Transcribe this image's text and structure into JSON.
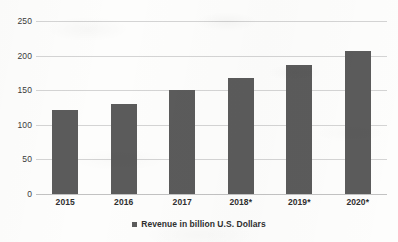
{
  "chart_data": {
    "type": "bar",
    "title": "",
    "subtitle": "",
    "xlabel": "",
    "ylabel": "",
    "categories": [
      "2015",
      "2016",
      "2017",
      "2018*",
      "2019*",
      "2020*"
    ],
    "values": [
      121,
      130,
      150,
      167,
      186,
      207
    ],
    "series": [
      {
        "name": "Revenue in billion U.S. Dollars",
        "values": [
          121,
          130,
          150,
          167,
          186,
          207
        ]
      }
    ],
    "ylim": [
      0,
      250
    ],
    "yticks": [
      "0",
      "50",
      "100",
      "150",
      "200",
      "250"
    ],
    "ytick_values": [
      0,
      50,
      100,
      150,
      200,
      250
    ],
    "grid": true,
    "legend": {
      "position": "bottom",
      "entries": [
        {
          "label": "Revenue in billion U.S. Dollars",
          "color": "#5b5b5b",
          "marker": "square"
        }
      ]
    },
    "colors": {
      "bar": "#5b5b5b",
      "gridline": "#d4d4d4",
      "axis": "#c2c2c2",
      "text": "#2f2f2f",
      "background": "#fdfdfc"
    }
  }
}
